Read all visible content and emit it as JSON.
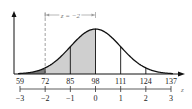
{
  "chart_data": {
    "type": "area",
    "title": "",
    "mean": 98,
    "std_dev": 13,
    "x_tick_labels": [
      "59",
      "72",
      "85",
      "98",
      "111",
      "124",
      "137"
    ],
    "x_values": [
      59,
      72,
      85,
      98,
      111,
      124,
      137
    ],
    "z_tick_labels": [
      "−3",
      "−2",
      "−1",
      "0",
      "1",
      "2",
      "3"
    ],
    "z_values": [
      -3,
      -2,
      -1,
      0,
      1,
      2,
      3
    ],
    "z_axis_label": "z",
    "annotation": "z = −2",
    "shaded_regions": [
      {
        "from": 59,
        "to": 72,
        "shade": "dark",
        "color": "#7a7a7a"
      },
      {
        "from": 72,
        "to": 98,
        "shade": "light",
        "color": "#cfcfcf"
      }
    ],
    "vertical_lines_at": [
      72,
      85,
      98,
      111,
      124
    ],
    "dashed_line_at": 72,
    "xlabel": "",
    "ylabel": "",
    "grid": false
  },
  "colors": {
    "curve": "#111111",
    "dark_shade": "#7a7a7a",
    "light_shade": "#cfcfcf",
    "bracket": "#888888"
  }
}
